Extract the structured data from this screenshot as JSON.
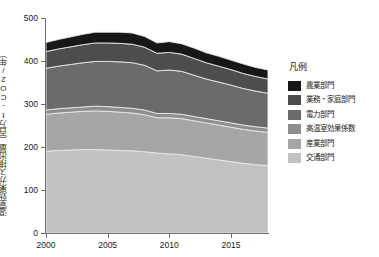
{
  "axes": {
    "ylabel": "温室効果ガス排出量（百万t-CO2/年）",
    "yticks": [
      "0",
      "100",
      "200",
      "300",
      "400",
      "500"
    ],
    "xticks": [
      "2000",
      "2005",
      "2010",
      "2015"
    ]
  },
  "legend": {
    "title": "凡例",
    "items": [
      {
        "label": "農業部門",
        "color": "#17171a"
      },
      {
        "label": "業務・家庭部門",
        "color": "#4d4d50"
      },
      {
        "label": "電力部門",
        "color": "#6b6b6e"
      },
      {
        "label": "高温室効果係数",
        "color": "#8e8e90"
      },
      {
        "label": "産業部門",
        "color": "#a6a6a8"
      },
      {
        "label": "交通部門",
        "color": "#c2c2c4"
      }
    ]
  },
  "chart_data": {
    "type": "area",
    "stacked": true,
    "title": "",
    "xlabel": "",
    "ylabel": "温室効果ガス排出量（百万t-CO2/年）",
    "xlim": [
      2000,
      2018
    ],
    "ylim": [
      0,
      500
    ],
    "grid": false,
    "legend_position": "right",
    "x": [
      2000,
      2001,
      2002,
      2003,
      2004,
      2005,
      2006,
      2007,
      2008,
      2009,
      2010,
      2011,
      2012,
      2013,
      2014,
      2015,
      2016,
      2017,
      2018
    ],
    "series": [
      {
        "name": "交通部門",
        "color": "#c2c2c4",
        "values": [
          190,
          192,
          193,
          194,
          194,
          193,
          192,
          191,
          189,
          186,
          184,
          182,
          178,
          174,
          170,
          166,
          162,
          159,
          157
        ]
      },
      {
        "name": "産業部門",
        "color": "#a6a6a8",
        "values": [
          86,
          87,
          88,
          89,
          90,
          90,
          89,
          88,
          86,
          82,
          84,
          84,
          83,
          82,
          81,
          80,
          79,
          78,
          77
        ]
      },
      {
        "name": "高温室効果係数",
        "color": "#8e8e90",
        "values": [
          10,
          10,
          10,
          10,
          11,
          11,
          11,
          11,
          11,
          10,
          10,
          10,
          10,
          10,
          10,
          10,
          10,
          10,
          10
        ]
      },
      {
        "name": "電力部門",
        "color": "#6b6b6e",
        "values": [
          97,
          99,
          101,
          103,
          104,
          105,
          106,
          106,
          104,
          99,
          101,
          100,
          96,
          92,
          90,
          88,
          85,
          83,
          81
        ]
      },
      {
        "name": "業務・家庭部門",
        "color": "#4d4d50",
        "values": [
          39,
          40,
          41,
          42,
          43,
          43,
          43,
          43,
          42,
          41,
          41,
          40,
          39,
          38,
          37,
          36,
          35,
          34,
          33
        ]
      },
      {
        "name": "農業部門",
        "color": "#17171a",
        "values": [
          21,
          22,
          23,
          24,
          25,
          25,
          26,
          26,
          25,
          24,
          25,
          24,
          24,
          23,
          23,
          22,
          22,
          21,
          21
        ]
      }
    ],
    "totals": [
      443,
      450,
      456,
      462,
      467,
      467,
      467,
      465,
      457,
      442,
      445,
      440,
      430,
      419,
      411,
      402,
      393,
      385,
      379
    ]
  }
}
